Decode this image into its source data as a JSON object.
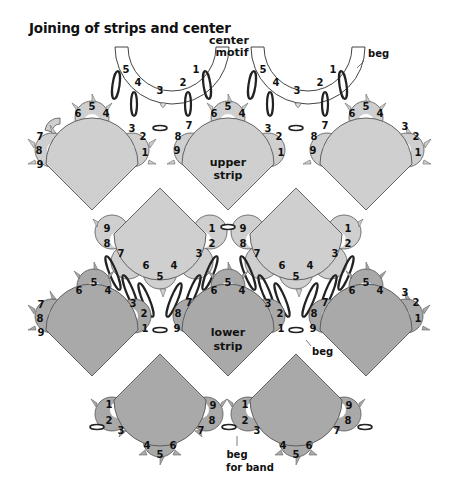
{
  "title": "Joining of strips and center",
  "colors": {
    "upper_fill": "#cfcfcf",
    "lower_fill": "#a9a9a9",
    "outline": "#555555",
    "background": "#ffffff"
  },
  "labels": {
    "center_motif_line1": "center",
    "center_motif_line2": "motif",
    "beg_top": "beg",
    "upper_strip_line1": "upper",
    "upper_strip_line2": "strip",
    "lower_strip_line1": "lower",
    "lower_strip_line2": "strip",
    "beg_lower": "beg",
    "beg_band_line1": "beg",
    "beg_band_line2": "for band"
  },
  "center_motifs": [
    {
      "numbers": [
        "5",
        "4",
        "3",
        "2",
        "1"
      ]
    },
    {
      "numbers": [
        "5",
        "4",
        "3",
        "2",
        "1"
      ]
    }
  ],
  "upper_strip": {
    "motifs_top_row": 3,
    "motifs_inverted_row": 2,
    "ring_numbers": [
      "1",
      "2",
      "3",
      "4",
      "5",
      "6",
      "7",
      "8",
      "9"
    ]
  },
  "lower_strip": {
    "motifs_top_row": 3,
    "motifs_inverted_row": 2,
    "ring_numbers": [
      "1",
      "2",
      "3",
      "4",
      "5",
      "6",
      "7",
      "8",
      "9"
    ]
  }
}
